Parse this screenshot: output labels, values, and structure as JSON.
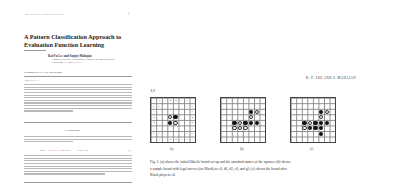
{
  "left_page": {
    "journal": "Artificial Intelligence",
    "page_number": "1",
    "title": "A Pattern Classification Approach to Evaluation Function Learning",
    "authors": "Kai-Fu Lee and Sanjoy Mahajan",
    "affiliation": [
      "Computer Science Department, Carnegie Mellon University,",
      "Pittsburgh, PA 15213, U.S.A."
    ],
    "recommended": "Recommended by Paul Rosenbloom",
    "abstract_heading": "ABSTRACT",
    "section_heading": "1. Introduction",
    "equation": "Eval = C1 × F1 + C2 × F2 + ··· + Cn × Fn",
    "equation_number": "(1)"
  },
  "right_page": {
    "page_number": "12",
    "running_head": "K.-F. LEE AND S. MAHAJAN",
    "board_a": {
      "label": "(a)",
      "top_labels": [
        "",
        "C",
        "A",
        "B",
        "B",
        "A",
        "C",
        ""
      ],
      "side_labels": [
        "",
        "C",
        "A",
        "B",
        "B",
        "A",
        "C",
        ""
      ],
      "x_squares": [
        "X",
        "X",
        "X",
        "X"
      ]
    },
    "board_b": {
      "label": "(b)"
    },
    "board_c": {
      "label": "(c)"
    },
    "caption": [
      "Fig. 3. (a) shows the initial Othello board set-up and the standard names of the squares; (b) shows",
      "a sample board with legal moves (for Black) to e6, d6, d2, e6, and g5; (c) shows the board after",
      "Black plays to e6."
    ]
  }
}
